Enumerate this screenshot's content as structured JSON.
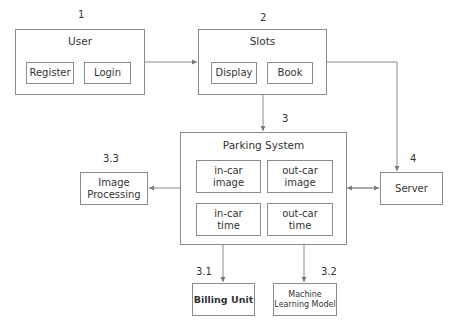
{
  "diagram": {
    "user": {
      "number": "1",
      "title": "User",
      "items": [
        "Register",
        "Login"
      ]
    },
    "slots": {
      "number": "2",
      "title": "Slots",
      "items": [
        "Display",
        "Book"
      ]
    },
    "parking_system": {
      "number": "3",
      "title": "Parking System",
      "items": [
        {
          "line1": "in-car",
          "line2": "image"
        },
        {
          "line1": "out-car",
          "line2": "image"
        },
        {
          "line1": "in-car",
          "line2": "time"
        },
        {
          "line1": "out-car",
          "line2": "time"
        }
      ]
    },
    "image_processing": {
      "number": "3.3",
      "line1": "Image",
      "line2": "Processing"
    },
    "server": {
      "number": "4",
      "label": "Server"
    },
    "billing": {
      "number": "3.1",
      "label": "Billing Unit"
    },
    "ml_model": {
      "number": "3.2",
      "line1": "Machine",
      "line2": "Learning Model"
    },
    "line_color": "#8a8a8a"
  }
}
